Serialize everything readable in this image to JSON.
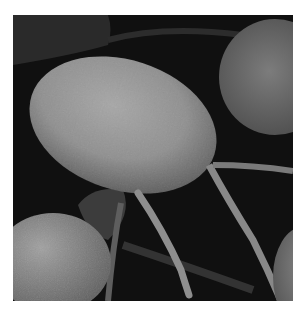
{
  "image": {
    "subject": "scanning electron micrograph of flagellated cells",
    "description": "Grayscale SEM image: a large oval cell with a textured surface in the center-top, two long flagella extending downward, partial cells at the top-right, bottom-left and bottom-right edges on a dark background",
    "colors": {
      "background": "#101010",
      "cell_light": "#9a9a9a",
      "cell_mid": "#7a7a7a",
      "cell_dark": "#4a4a4a",
      "flagellum": "#8c8c8c",
      "page": "#ffffff"
    }
  }
}
